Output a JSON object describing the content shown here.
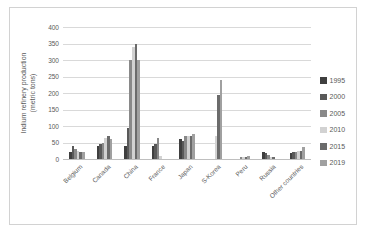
{
  "chart_data": {
    "type": "bar",
    "title": "",
    "ylabel_line1": "Indium refinery production",
    "ylabel_line2": "(metric tons)",
    "xlabel": "",
    "ylim": [
      0,
      400
    ],
    "ytick_step": 50,
    "grid": true,
    "legend_position": "right",
    "categories": [
      "Belgium",
      "Canada",
      "China",
      "France",
      "Japan",
      "S-Korea",
      "Peru",
      "Russia",
      "Other countries"
    ],
    "series": [
      {
        "name": "1995",
        "color": "#3f3f3f",
        "values": [
          20,
          40,
          40,
          40,
          60,
          0,
          0,
          20,
          18
        ]
      },
      {
        "name": "2000",
        "color": "#595959",
        "values": [
          40,
          45,
          95,
          45,
          55,
          0,
          0,
          18,
          20
        ]
      },
      {
        "name": "2005",
        "color": "#898989",
        "values": [
          30,
          50,
          300,
          65,
          70,
          0,
          5,
          12,
          22
        ]
      },
      {
        "name": "2010",
        "color": "#d2d2d2",
        "values": [
          25,
          65,
          340,
          10,
          70,
          70,
          5,
          5,
          25
        ]
      },
      {
        "name": "2015",
        "color": "#6b6b6b",
        "values": [
          20,
          70,
          350,
          0,
          70,
          195,
          5,
          5,
          25
        ]
      },
      {
        "name": "2019",
        "color": "#a0a0a0",
        "values": [
          20,
          60,
          300,
          0,
          75,
          240,
          10,
          0,
          35
        ]
      }
    ],
    "colors": {
      "gridline": "#d9d9d9",
      "axis_line": "#bfbfbf",
      "text": "#595959",
      "frame_border": "#d2d2d2"
    }
  }
}
